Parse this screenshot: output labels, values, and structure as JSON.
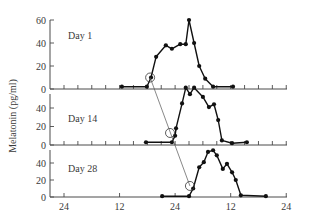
{
  "chart_data": {
    "type": "line",
    "title": "",
    "ylabel": "Melatonin (pg/ml)",
    "xlabel": "",
    "x_tick_labels": [
      "24",
      "12",
      "24",
      "12",
      "24"
    ],
    "x_tick_hours": [
      0,
      12,
      24,
      36,
      48
    ],
    "minor_tick_interval_hours": 3,
    "xlim_hours": [
      -3,
      48
    ],
    "grid": false,
    "legend": null,
    "panels": [
      {
        "name": "Day 1",
        "label": "Day 1",
        "y_tick_labels": [
          "0",
          "20",
          "40",
          "60"
        ],
        "y_ticks": [
          0,
          20,
          40,
          60
        ],
        "ylim": [
          0,
          60
        ],
        "x_hours": [
          12.5,
          17.9,
          18.8,
          19.9,
          22.0,
          23.3,
          25.1,
          26.3,
          27.0,
          28.1,
          29.2,
          30.5,
          32.2,
          36.5
        ],
        "values": [
          2,
          2,
          10,
          28,
          38,
          35,
          39,
          39,
          60,
          40,
          20,
          9,
          2,
          2
        ],
        "onset": {
          "x_hour": 18.6,
          "value": 10
        }
      },
      {
        "name": "Day 14",
        "label": "Day 14",
        "y_tick_labels": [
          "0",
          "20",
          "40"
        ],
        "y_ticks": [
          0,
          20,
          40
        ],
        "ylim": [
          0,
          40
        ],
        "x_hours": [
          17.7,
          23.3,
          24.0,
          24.2,
          25.5,
          26.3,
          27.2,
          28.1,
          30.0,
          31.3,
          32.4,
          33.3,
          34.1,
          36.3,
          39.5
        ],
        "values": [
          3,
          3,
          10,
          18,
          45,
          62,
          55,
          62,
          52,
          41,
          44,
          27,
          5,
          2,
          3
        ],
        "onset": {
          "x_hour": 22.9,
          "value": 13
        }
      },
      {
        "name": "Day 28",
        "label": "Day 28",
        "y_tick_labels": [
          "0",
          "20",
          "40"
        ],
        "y_ticks": [
          0,
          20,
          40
        ],
        "ylim": [
          0,
          40
        ],
        "x_hours": [
          21.2,
          27.0,
          27.9,
          29.2,
          30.2,
          31.1,
          32.2,
          33.0,
          34.3,
          35.2,
          36.3,
          37.1,
          38.2,
          43.6
        ],
        "values": [
          1,
          1,
          10,
          35,
          41,
          53,
          55,
          49,
          33,
          39,
          29,
          20,
          2,
          1
        ],
        "onset": {
          "x_hour": 27.2,
          "value": 13
        }
      }
    ],
    "annotations": [
      "Open circles mark melatonin onset; a thin line connects onset on Day 1 to Day 28"
    ]
  },
  "layout": {
    "x_origin_px": 64,
    "px_per_hour": 4.63,
    "y_axis_x_px": 50,
    "x_axis_end_px": 287,
    "panel_px": [
      {
        "zero_y": 89,
        "px_per_unit": 1.15,
        "top_y": 20,
        "label_x": 68,
        "label_y": 39
      },
      {
        "zero_y": 145,
        "px_per_unit": 0.925,
        "top_y": 94,
        "label_x": 68,
        "label_y": 122
      },
      {
        "zero_y": 197,
        "px_per_unit": 0.85,
        "top_y": 150,
        "label_x": 68,
        "label_y": 172
      }
    ]
  }
}
